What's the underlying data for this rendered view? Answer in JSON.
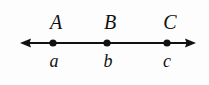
{
  "figure": {
    "type": "number-line",
    "background_color": "#fdfdfd",
    "stroke_color": "#111111"
  },
  "axis": {
    "orientation": "horizontal",
    "y_position": 43,
    "x_start": 20,
    "x_end": 196,
    "line_thickness": 2,
    "left_arrow": true,
    "right_arrow": true,
    "arrow_length": 11,
    "arrow_halfwidth": 4.5
  },
  "points": [
    {
      "x": 53,
      "dot_radius": 3.6,
      "upper_label": "A",
      "lower_label": "a",
      "upper_label_x": 56,
      "lower_label_x": 54
    },
    {
      "x": 107,
      "dot_radius": 3.6,
      "upper_label": "B",
      "lower_label": "b",
      "upper_label_x": 110,
      "lower_label_x": 108
    },
    {
      "x": 167,
      "dot_radius": 3.6,
      "upper_label": "C",
      "lower_label": "c",
      "upper_label_x": 170,
      "lower_label_x": 167
    }
  ]
}
